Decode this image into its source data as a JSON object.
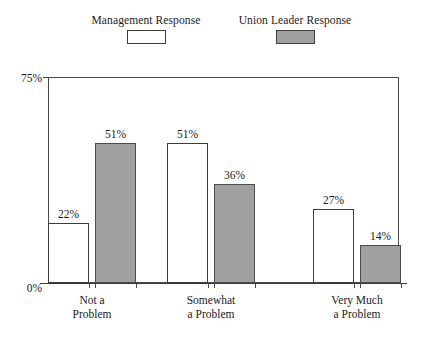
{
  "chart_data": {
    "type": "bar",
    "title": "",
    "subtitle": "",
    "xlabel": "",
    "ylabel": "",
    "ylim": [
      0,
      75
    ],
    "grid": false,
    "legend_position": "top",
    "y_tick_labels": [
      "0%",
      "75%"
    ],
    "categories": [
      "Not a Problem",
      "Somewhat a Problem",
      "Very Much a Problem"
    ],
    "category_lines": [
      {
        "line1": "Not a",
        "line2": "Problem"
      },
      {
        "line1": "Somewhat",
        "line2": "a Problem"
      },
      {
        "line1": "Very Much",
        "line2": "a Problem"
      }
    ],
    "series": [
      {
        "name": "Management Response",
        "values": [
          22,
          51,
          27
        ],
        "labels": [
          "22%",
          "51%",
          "27%"
        ],
        "color": "#ffffff"
      },
      {
        "name": "Union Leader Response",
        "values": [
          51,
          36,
          14
        ],
        "labels": [
          "51%",
          "36%",
          "14%"
        ],
        "color": "#a0a0a0"
      }
    ]
  },
  "legend": {
    "entries": [
      {
        "label": "Management Response",
        "swatch": "white-swatch"
      },
      {
        "label": "Union Leader Response",
        "swatch": "gray-swatch"
      }
    ]
  },
  "axis": {
    "y_top_label": "75%",
    "y_bottom_label": "0%"
  },
  "colors": {
    "bar_management": "#ffffff",
    "bar_union": "#a0a0a0",
    "outline": "#3d3d3d",
    "axis": "#4a4a4a",
    "text": "#1a1a1a",
    "background": "#ffffff"
  }
}
